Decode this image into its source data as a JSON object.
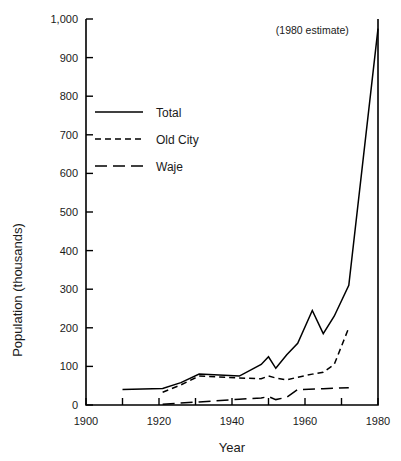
{
  "chart_data": {
    "type": "line",
    "title": "",
    "xlabel": "Year",
    "ylabel": "Population (thousands)",
    "xlim": [
      1900,
      1980
    ],
    "ylim": [
      0,
      1000
    ],
    "xticks": [
      1900,
      1910,
      1920,
      1930,
      1940,
      1950,
      1960,
      1970,
      1980
    ],
    "xtick_labels": [
      "1900",
      "",
      "1920",
      "",
      "1940",
      "",
      "1960",
      "",
      "1980"
    ],
    "xtick_labels_shown": [
      "1900",
      "1920",
      "1940",
      "1960",
      "1980"
    ],
    "yticks": [
      0,
      100,
      200,
      300,
      400,
      500,
      600,
      700,
      800,
      900,
      1000
    ],
    "ytick_labels": [
      "0",
      "100",
      "200",
      "300",
      "400",
      "500",
      "600",
      "700",
      "800",
      "900",
      "1,000"
    ],
    "grid": false,
    "legend_position": "upper-left-inside",
    "annotations": [
      {
        "text": "(1980 estimate)",
        "x": 1962,
        "y": 960
      }
    ],
    "series": [
      {
        "name": "Total",
        "style": "solid",
        "x": [
          1910,
          1921,
          1926,
          1931,
          1942,
          1948,
          1950,
          1952,
          1955,
          1958,
          1962,
          1965,
          1968,
          1972,
          1980
        ],
        "values": [
          40,
          43,
          58,
          80,
          75,
          105,
          125,
          95,
          130,
          160,
          245,
          185,
          230,
          310,
          975
        ]
      },
      {
        "name": "Old City",
        "style": "dashed-short",
        "x": [
          1921,
          1926,
          1931,
          1942,
          1948,
          1950,
          1952,
          1955,
          1958,
          1962,
          1965,
          1968,
          1972
        ],
        "values": [
          33,
          52,
          75,
          70,
          68,
          75,
          70,
          65,
          72,
          80,
          85,
          105,
          200
        ]
      },
      {
        "name": "Waje",
        "style": "dashed-long",
        "x": [
          1921,
          1931,
          1942,
          1948,
          1950,
          1952,
          1955,
          1958,
          1965,
          1972
        ],
        "values": [
          2,
          8,
          15,
          18,
          22,
          14,
          20,
          40,
          42,
          45
        ]
      }
    ]
  },
  "legend": {
    "items": [
      {
        "label": "Total",
        "style": "solid"
      },
      {
        "label": "Old City",
        "style": "dashed-short"
      },
      {
        "label": "Waje",
        "style": "dashed-long"
      }
    ]
  }
}
